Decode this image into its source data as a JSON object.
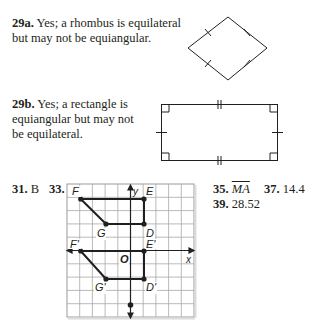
{
  "answers": {
    "a29a": {
      "number": "29a.",
      "line1": "Yes; a rhombus is equilateral",
      "line2": "but may not be equiangular."
    },
    "a29b": {
      "number": "29b.",
      "line1": "Yes; a rectangle is",
      "line2": "equiangular but may not",
      "line3": "be equilateral."
    },
    "a31": {
      "number": "31.",
      "value": "B"
    },
    "a33": {
      "number": "33."
    },
    "a35": {
      "number": "35.",
      "value": "MA"
    },
    "a37": {
      "number": "37.",
      "value": "14.4"
    },
    "a39": {
      "number": "39.",
      "value": "28.52"
    }
  },
  "graph": {
    "x_axis_label": "x",
    "y_axis_label": "y",
    "origin_label": "O",
    "points": {
      "F": "F",
      "E": "E",
      "G": "G",
      "D": "D",
      "F_prime": "F'",
      "E_prime": "E'",
      "G_prime": "G'",
      "D_prime": "D'"
    }
  }
}
